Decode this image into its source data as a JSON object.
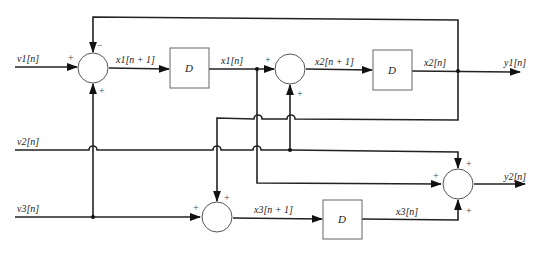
{
  "diagram": {
    "type": "block-diagram",
    "inputs": {
      "v1": "v1[n]",
      "v2": "v2[n]",
      "v3": "v3[n]"
    },
    "outputs": {
      "y1": "y1[n]",
      "y2": "y2[n]"
    },
    "signals": {
      "x1_next": "x1[n + 1]",
      "x1": "x1[n]",
      "x2_next": "x2[n + 1]",
      "x2": "x2[n]",
      "x3_next": "x3[n + 1]",
      "x3": "x3[n]"
    },
    "delays": [
      {
        "label": "D"
      },
      {
        "label": "D"
      },
      {
        "label": "D"
      }
    ],
    "adders": [
      {
        "id": "adder1",
        "signs": {
          "left": "+",
          "top": "−",
          "bottom": "+"
        }
      },
      {
        "id": "adder2",
        "signs": {
          "left": "+",
          "bottom": "+"
        }
      },
      {
        "id": "adder3",
        "signs": {
          "left": "+",
          "top": "+"
        }
      },
      {
        "id": "adder4",
        "signs": {
          "left": "+",
          "top": "+",
          "bottom": "+"
        }
      }
    ]
  }
}
